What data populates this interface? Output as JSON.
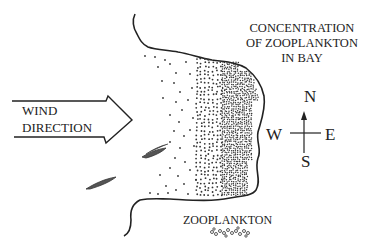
{
  "diagram": {
    "title_lines": [
      "CONCENTRATION",
      "OF ZOOPLANKTON",
      "IN BAY"
    ],
    "wind_label_lines": [
      "WIND",
      "DIRECTION"
    ],
    "compass": {
      "north": "N",
      "south": "S",
      "east": "E",
      "west": "W"
    },
    "legend_label": "ZOOPLANKTON",
    "icons": [
      "wind-arrow-icon",
      "compass-icon",
      "fish-icon",
      "zooplankton-symbol-icon"
    ],
    "colors": {
      "ink": "#222222",
      "background": "#ffffff"
    }
  }
}
